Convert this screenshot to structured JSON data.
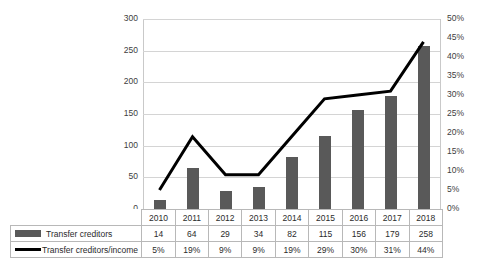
{
  "chart_data": {
    "type": "bar",
    "title": "",
    "xlabel": "",
    "ylabel": "",
    "grid": true,
    "legend_position": "table-below",
    "categories": [
      "2010",
      "2011",
      "2012",
      "2013",
      "2014",
      "2015",
      "2016",
      "2017",
      "2018"
    ],
    "series": [
      {
        "name": "Transfer creditors",
        "type": "bar",
        "axis": "left",
        "color": "#595959",
        "values": [
          14,
          64,
          29,
          34,
          82,
          115,
          156,
          179,
          258
        ],
        "value_labels": [
          "14",
          "64",
          "29",
          "34",
          "82",
          "115",
          "156",
          "179",
          "258"
        ]
      },
      {
        "name": "Transfer creditors/income",
        "type": "line",
        "axis": "right",
        "color": "#000000",
        "values": [
          5,
          19,
          9,
          9,
          19,
          29,
          30,
          31,
          44
        ],
        "value_labels": [
          "5%",
          "19%",
          "9%",
          "9%",
          "19%",
          "29%",
          "30%",
          "31%",
          "44%"
        ]
      }
    ],
    "left_axis": {
      "min": 0,
      "max": 300,
      "step": 50,
      "ticks": [
        0,
        50,
        100,
        150,
        200,
        250,
        300
      ],
      "tick_labels": [
        "0",
        "50",
        "100",
        "150",
        "200",
        "250",
        "300"
      ]
    },
    "right_axis": {
      "min": 0,
      "max": 50,
      "step": 5,
      "ticks": [
        0,
        5,
        10,
        15,
        20,
        25,
        30,
        35,
        40,
        45,
        50
      ],
      "tick_labels": [
        "0%",
        "5%",
        "10%",
        "15%",
        "20%",
        "25%",
        "30%",
        "35%",
        "40%",
        "45%",
        "50%"
      ]
    }
  },
  "table": {
    "year_header": [
      "2010",
      "2011",
      "2012",
      "2013",
      "2014",
      "2015",
      "2016",
      "2017",
      "2018"
    ],
    "rows": [
      {
        "legend_label": "Transfer creditors",
        "legend_kind": "bar-swatch",
        "cells": [
          "14",
          "64",
          "29",
          "34",
          "82",
          "115",
          "156",
          "179",
          "258"
        ]
      },
      {
        "legend_label": "Transfer creditors/income",
        "legend_kind": "line-swatch",
        "cells": [
          "5%",
          "19%",
          "9%",
          "9%",
          "19%",
          "29%",
          "30%",
          "31%",
          "44%"
        ]
      }
    ]
  },
  "colors": {
    "bar": "#595959",
    "line": "#000000",
    "gridline": "#d4d4d4",
    "axis": "#b0b0b0",
    "table_border": "#b8b8b8",
    "background": "#ffffff",
    "text": "#2b2b2b"
  }
}
